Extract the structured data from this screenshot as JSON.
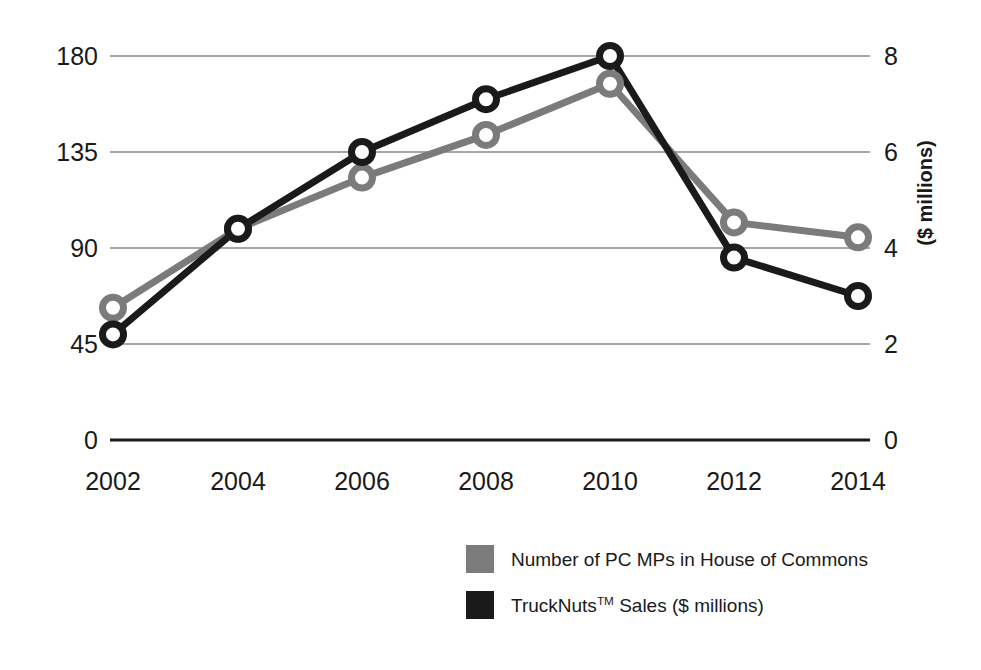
{
  "chart_data": {
    "type": "line",
    "title": "",
    "subtitle": "",
    "xlabel": "",
    "ylabel": "",
    "categories": [
      "2002",
      "2004",
      "2006",
      "2008",
      "2010",
      "2012",
      "2014"
    ],
    "x": [
      2002,
      2004,
      2006,
      2008,
      2010,
      2012,
      2014
    ],
    "grid": true,
    "legend_position": "bottom-right",
    "axes": {
      "left": {
        "label": "",
        "ticks": [
          "0",
          "45",
          "90",
          "135",
          "180"
        ],
        "tick_values": [
          0,
          45,
          90,
          135,
          180
        ],
        "min": 0,
        "max": 180
      },
      "right": {
        "label": "($ millions)",
        "ticks": [
          "0",
          "2",
          "4",
          "6",
          "8"
        ],
        "tick_values": [
          0,
          2,
          4,
          6,
          8
        ],
        "min": 0,
        "max": 8
      }
    },
    "series": [
      {
        "name": "Number of PC MPs in House of Commons",
        "axis": "left",
        "color": "#7b7b7b",
        "marker": "open-circle",
        "values": [
          62,
          99,
          123,
          143,
          167,
          102,
          95
        ]
      },
      {
        "name": "TruckNuts™ Sales ($ millions)",
        "axis": "right",
        "color": "#1a1a1a",
        "marker": "open-circle",
        "values": [
          2.2,
          4.4,
          6.0,
          7.1,
          8.0,
          3.8,
          3.0
        ]
      }
    ]
  },
  "legend": {
    "items": [
      {
        "label_prefix": "Number of PC MPs in House of Commons",
        "label_sup": "",
        "label_suffix": "",
        "color": "#7b7b7b",
        "swatch_name": "legend-swatch-pc-mps"
      },
      {
        "label_prefix": "TruckNuts",
        "label_sup": "TM",
        "label_suffix": " Sales ($ millions)",
        "color": "#1a1a1a",
        "swatch_name": "legend-swatch-trucknuts"
      }
    ]
  },
  "colors": {
    "background": "#ffffff",
    "series_gray": "#7b7b7b",
    "series_black": "#1a1a1a",
    "gridline": "#8a8a8a",
    "axis_line": "#1a1a1a",
    "text": "#1a1a1a"
  },
  "geometry": {
    "plot_left": 110,
    "plot_right": 870,
    "y_for_value": {
      "v180": 56,
      "v135": 148,
      "v90": 243,
      "v45": 339,
      "v0": 440
    },
    "x_positions": [
      113,
      238,
      362,
      486,
      610,
      734,
      858
    ],
    "left_tick_label_x": 98,
    "right_tick_label_x": 884,
    "x_tick_label_y": 490
  }
}
